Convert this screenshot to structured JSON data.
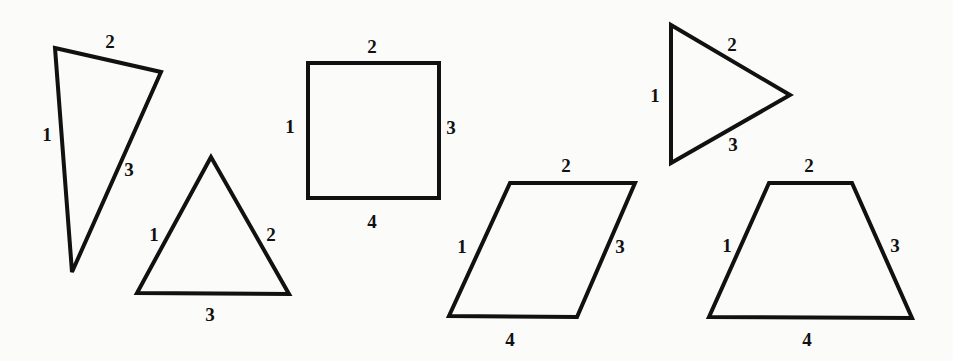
{
  "diagram": {
    "background": "#fbfbfa",
    "stroke_color": "#111111",
    "shapes": [
      {
        "name": "obtuse-triangle",
        "type": "triangle",
        "points": [
          [
            55,
            48
          ],
          [
            161,
            72
          ],
          [
            72,
            272
          ]
        ],
        "labels": [
          {
            "text": "1",
            "x": 47,
            "y": 141
          },
          {
            "text": "2",
            "x": 110,
            "y": 48
          },
          {
            "text": "3",
            "x": 129,
            "y": 176
          }
        ]
      },
      {
        "name": "equilateral-triangle",
        "type": "triangle",
        "points": [
          [
            211,
            157
          ],
          [
            137,
            293
          ],
          [
            289,
            294
          ]
        ],
        "labels": [
          {
            "text": "1",
            "x": 154,
            "y": 241
          },
          {
            "text": "2",
            "x": 271,
            "y": 241
          },
          {
            "text": "3",
            "x": 210,
            "y": 321
          }
        ]
      },
      {
        "name": "square",
        "type": "square",
        "points": [
          [
            308,
            63
          ],
          [
            439,
            63
          ],
          [
            439,
            198
          ],
          [
            308,
            198
          ]
        ],
        "labels": [
          {
            "text": "1",
            "x": 290,
            "y": 133
          },
          {
            "text": "2",
            "x": 372,
            "y": 53
          },
          {
            "text": "3",
            "x": 451,
            "y": 134
          },
          {
            "text": "4",
            "x": 372,
            "y": 228
          }
        ]
      },
      {
        "name": "right-pointing-triangle",
        "type": "triangle",
        "points": [
          [
            671,
            25
          ],
          [
            790,
            95
          ],
          [
            671,
            163
          ]
        ],
        "labels": [
          {
            "text": "1",
            "x": 655,
            "y": 102
          },
          {
            "text": "2",
            "x": 732,
            "y": 51
          },
          {
            "text": "3",
            "x": 733,
            "y": 151
          }
        ]
      },
      {
        "name": "parallelogram",
        "type": "parallelogram",
        "points": [
          [
            510,
            183
          ],
          [
            635,
            183
          ],
          [
            577,
            317
          ],
          [
            449,
            316
          ]
        ],
        "labels": [
          {
            "text": "1",
            "x": 462,
            "y": 253
          },
          {
            "text": "2",
            "x": 566,
            "y": 172
          },
          {
            "text": "3",
            "x": 620,
            "y": 253
          },
          {
            "text": "4",
            "x": 510,
            "y": 346
          }
        ]
      },
      {
        "name": "trapezoid",
        "type": "trapezoid",
        "points": [
          [
            769,
            183
          ],
          [
            852,
            183
          ],
          [
            912,
            318
          ],
          [
            709,
            317
          ]
        ],
        "labels": [
          {
            "text": "1",
            "x": 727,
            "y": 252
          },
          {
            "text": "2",
            "x": 809,
            "y": 172
          },
          {
            "text": "3",
            "x": 895,
            "y": 252
          },
          {
            "text": "4",
            "x": 807,
            "y": 346
          }
        ]
      }
    ]
  }
}
